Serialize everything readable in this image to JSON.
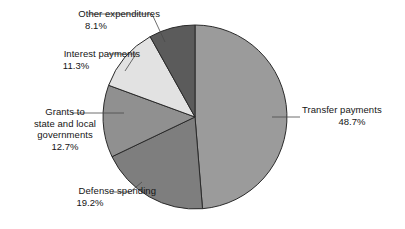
{
  "chart_data": {
    "type": "pie",
    "title": "",
    "subtitle": "",
    "xlabel": "",
    "ylabel": "",
    "legend_position": "none",
    "grid": false,
    "units": "percent",
    "categories": [
      "Transfer payments",
      "Defense spending",
      "Grants to state and local governments",
      "Interest payments",
      "Other expenditures"
    ],
    "values": [
      48.7,
      19.2,
      12.7,
      11.3,
      8.1
    ],
    "slices": [
      {
        "id": "transfer-payments",
        "label": "Transfer payments",
        "label_lines": [
          "Transfer payments"
        ],
        "value": 48.7,
        "value_text": "48.7%",
        "color": "#9b9b9b",
        "start_angle_deg": 0,
        "end_angle_deg": 175.32
      },
      {
        "id": "defense-spending",
        "label": "Defense spending",
        "label_lines": [
          "Defense spending"
        ],
        "value": 19.2,
        "value_text": "19.2%",
        "color": "#7e7e7e",
        "start_angle_deg": 175.32,
        "end_angle_deg": 244.44
      },
      {
        "id": "grants-to-state-and-local-governments",
        "label": "Grants to state and local governments",
        "label_lines": [
          "Grants to",
          "state and local",
          "governments"
        ],
        "value": 12.7,
        "value_text": "12.7%",
        "color": "#909090",
        "start_angle_deg": 244.44,
        "end_angle_deg": 290.16
      },
      {
        "id": "interest-payments",
        "label": "Interest payments",
        "label_lines": [
          "Interest payments"
        ],
        "value": 11.3,
        "value_text": "11.3%",
        "color": "#e2e2e2",
        "start_angle_deg": 290.16,
        "end_angle_deg": 330.84
      },
      {
        "id": "other-expenditures",
        "label": "Other expenditures",
        "label_lines": [
          "Other expenditures"
        ],
        "value": 8.1,
        "value_text": "8.1%",
        "color": "#5b5b5b",
        "start_angle_deg": 330.84,
        "end_angle_deg": 360
      }
    ],
    "geometry": {
      "center_x": 195,
      "center_y": 117,
      "radius": 92,
      "start_at_top": true,
      "direction": "clockwise"
    },
    "style": {
      "background": "#ffffff",
      "slice_outline": "#2a2a2a",
      "leader_line": "#4a4a4a",
      "text_color": "#151515"
    }
  },
  "labels": {
    "transfer": {
      "name": "Transfer payments",
      "value": "48.7%"
    },
    "defense": {
      "name": "Defense spending",
      "value": "19.2%"
    },
    "grants": {
      "line1": "Grants to",
      "line2": "state and local",
      "line3": "governments",
      "value": "12.7%"
    },
    "interest": {
      "name": "Interest payments",
      "value": "11.3%"
    },
    "other": {
      "name": "Other expenditures",
      "value": "8.1%"
    }
  }
}
